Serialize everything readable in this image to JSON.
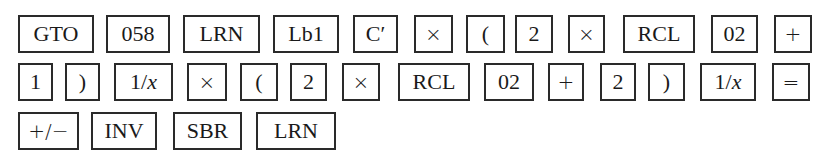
{
  "rows": [
    {
      "y": 15,
      "h": 38,
      "keys": [
        {
          "label": "GTO",
          "x": 18,
          "w": 76
        },
        {
          "label": "058",
          "x": 106,
          "w": 64
        },
        {
          "label": "LRN",
          "x": 183,
          "w": 77
        },
        {
          "label": "Lb1",
          "x": 273,
          "w": 66
        },
        {
          "label": "C′",
          "x": 353,
          "w": 45
        },
        {
          "label": "×",
          "x": 414,
          "w": 39,
          "op": true
        },
        {
          "label": "(",
          "x": 466,
          "w": 39
        },
        {
          "label": "2",
          "x": 515,
          "w": 38
        },
        {
          "label": "×",
          "x": 568,
          "w": 37,
          "op": true
        },
        {
          "label": "RCL",
          "x": 623,
          "w": 72
        },
        {
          "label": "02",
          "x": 711,
          "w": 47
        },
        {
          "label": "+",
          "x": 774,
          "w": 38,
          "op": true
        }
      ]
    },
    {
      "y": 63,
      "h": 38,
      "keys": [
        {
          "label": "1",
          "x": 18,
          "w": 35
        },
        {
          "label": ")",
          "x": 65,
          "w": 35
        },
        {
          "label": "1/x",
          "x": 114,
          "w": 59,
          "italic_x": true
        },
        {
          "label": "×",
          "x": 187,
          "w": 40,
          "op": true
        },
        {
          "label": "(",
          "x": 240,
          "w": 38
        },
        {
          "label": "2",
          "x": 290,
          "w": 37
        },
        {
          "label": "×",
          "x": 342,
          "w": 38,
          "op": true
        },
        {
          "label": "RCL",
          "x": 398,
          "w": 72
        },
        {
          "label": "02",
          "x": 484,
          "w": 50
        },
        {
          "label": "+",
          "x": 548,
          "w": 36,
          "op": true
        },
        {
          "label": "2",
          "x": 600,
          "w": 36
        },
        {
          "label": ")",
          "x": 648,
          "w": 37
        },
        {
          "label": "1/x",
          "x": 700,
          "w": 56,
          "italic_x": true
        },
        {
          "label": "=",
          "x": 772,
          "w": 38,
          "op": true
        }
      ]
    },
    {
      "y": 112,
      "h": 38,
      "keys": [
        {
          "label": "+/−",
          "x": 18,
          "w": 61,
          "op": true
        },
        {
          "label": "INV",
          "x": 91,
          "w": 66
        },
        {
          "label": "SBR",
          "x": 173,
          "w": 69
        },
        {
          "label": "LRN",
          "x": 256,
          "w": 80
        }
      ]
    }
  ]
}
